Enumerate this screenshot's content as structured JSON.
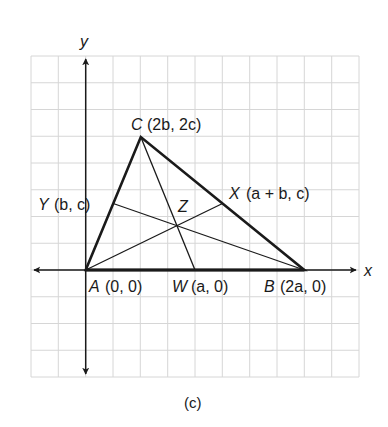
{
  "figure": {
    "caption": "(c)",
    "axes": {
      "x_label": "x",
      "y_label": "y"
    },
    "grid": {
      "columns": 12,
      "rows": 12,
      "line_color": "#d4d4d4"
    },
    "points": {
      "A": {
        "name": "A",
        "coords": "(0, 0)"
      },
      "B": {
        "name": "B",
        "coords": "(2a, 0)"
      },
      "C": {
        "name": "C",
        "coords": "(2b, 2c)"
      },
      "W": {
        "name": "W",
        "coords": "(a, 0)"
      },
      "X": {
        "name": "X",
        "coords": "(a + b, c)"
      },
      "Y": {
        "name": "Y",
        "coords": "(b, c)"
      },
      "Z": {
        "name": "Z"
      }
    },
    "segments": {
      "triangle": [
        "A-B",
        "B-C",
        "C-A"
      ],
      "medians": [
        "C-W",
        "A-X",
        "B-Y"
      ]
    },
    "colors": {
      "ink": "#1a1a1a",
      "grid": "#d4d4d4"
    }
  }
}
